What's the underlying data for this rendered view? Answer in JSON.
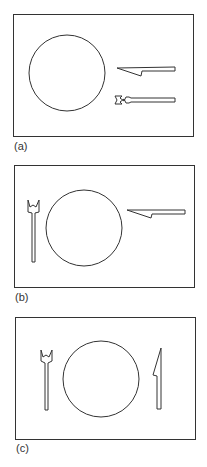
{
  "figure": {
    "panels": [
      {
        "label": "(a)",
        "description": "Plate with knife and fork placed to the right, pointing left"
      },
      {
        "label": "(b)",
        "description": "Fork left of plate, knife to the right pointing left"
      },
      {
        "label": "(c)",
        "description": "Fork left of plate, knife right of plate, both vertical"
      }
    ],
    "stroke_color": "#333333"
  }
}
